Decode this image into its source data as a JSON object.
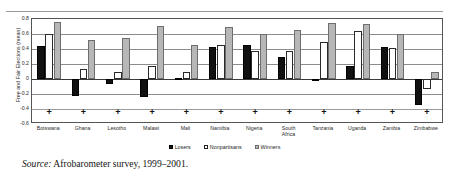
{
  "figure": {
    "source_label": "Source:",
    "source_text": "Afrobarometer survey, 1999–2001.",
    "marker_symbol": "+"
  },
  "chart_data": {
    "type": "bar",
    "title": "",
    "xlabel": "",
    "ylabel": "Free and Fair Elections (mean)",
    "ylim": [
      -0.6,
      0.8
    ],
    "yticks": [
      "0.8",
      "0.6",
      "0.4",
      "0.2",
      "0",
      "-0.2",
      "-0.4",
      "-0.6"
    ],
    "ytick_values": [
      0.8,
      0.6,
      0.4,
      0.2,
      0,
      -0.2,
      -0.4,
      -0.6
    ],
    "grid": true,
    "legend_position": "bottom-center",
    "categories": [
      "Botswana",
      "Ghana",
      "Lesotho",
      "Malawi",
      "Mali",
      "Namibia",
      "Nigeria",
      "South\nAfrica",
      "Tanzania",
      "Uganda",
      "Zambia",
      "Zimbabwe"
    ],
    "series": [
      {
        "name": "Losers",
        "color": "#111111",
        "values": [
          0.44,
          -0.22,
          -0.06,
          -0.24,
          0.01,
          0.43,
          0.45,
          0.29,
          -0.01,
          0.18,
          0.43,
          -0.34
        ]
      },
      {
        "name": "Nonpartisans",
        "color": "#ffffff",
        "values": [
          0.6,
          0.13,
          0.1,
          0.18,
          0.09,
          0.45,
          0.38,
          0.38,
          0.49,
          0.64,
          0.41,
          -0.13
        ]
      },
      {
        "name": "Winners",
        "color": "#b7b7b7",
        "values": [
          0.76,
          0.52,
          0.55,
          0.71,
          0.45,
          0.7,
          0.6,
          0.66,
          0.75,
          0.73,
          0.6,
          0.09
        ]
      }
    ]
  }
}
